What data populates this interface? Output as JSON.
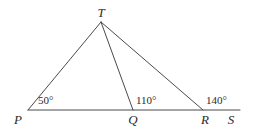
{
  "figure": {
    "kind": "geometry-diagram",
    "background_color": "#ffffff",
    "stroke_color": "#4a4a4a",
    "text_color": "#2b2b2b",
    "stroke_width": 1
  },
  "points": {
    "P": {
      "label": "P",
      "x": 28,
      "y": 110,
      "label_x": 18,
      "label_y": 119
    },
    "Q": {
      "label": "Q",
      "x": 133,
      "y": 110,
      "label_x": 133,
      "label_y": 119
    },
    "R": {
      "label": "R",
      "x": 203,
      "y": 110,
      "label_x": 205,
      "label_y": 119
    },
    "S": {
      "label": "S",
      "x": 240,
      "y": 110,
      "label_x": 231,
      "label_y": 119
    },
    "T": {
      "label": "T",
      "x": 101,
      "y": 22,
      "label_x": 101,
      "label_y": 12
    }
  },
  "segments": [
    {
      "name": "baseline-PS",
      "from": "P",
      "to": "S"
    },
    {
      "name": "segment-PT",
      "from": "P",
      "to": "T"
    },
    {
      "name": "segment-TQ",
      "from": "T",
      "to": "Q"
    },
    {
      "name": "segment-TR",
      "from": "T",
      "to": "R"
    }
  ],
  "angles": [
    {
      "name": "angle-at-P",
      "value": "50°",
      "vertex": "P",
      "label_x": 38,
      "label_y": 100
    },
    {
      "name": "angle-at-Q",
      "value": "110°",
      "vertex": "Q",
      "label_x": 136,
      "label_y": 100
    },
    {
      "name": "angle-at-R",
      "value": "140°",
      "vertex": "R",
      "label_x": 206,
      "label_y": 100
    }
  ]
}
